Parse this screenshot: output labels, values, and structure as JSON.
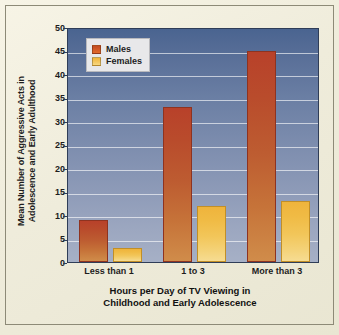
{
  "chart_data": {
    "type": "bar",
    "title": "",
    "categories": [
      "Less than 1",
      "1 to 3",
      "More than 3"
    ],
    "series": [
      {
        "name": "Males",
        "values": [
          9,
          33,
          45
        ],
        "color": "#bc4e2b"
      },
      {
        "name": "Females",
        "values": [
          3,
          12,
          13
        ],
        "color": "#f0bb45"
      }
    ],
    "xlabel": "Hours per Day of TV Viewing in\nChildhood and Early Adolescence",
    "ylabel": "Mean Number of Aggressive Acts in\nAdolescence and Early Adulthood",
    "ylim": [
      0,
      50
    ],
    "yticks": [
      "0",
      "5",
      "10",
      "15",
      "20",
      "25",
      "30",
      "35",
      "40",
      "45",
      "50"
    ],
    "ytick_values": [
      0,
      5,
      10,
      15,
      20,
      25,
      30,
      35,
      40,
      45,
      50
    ],
    "grid": true,
    "legend_position": "upper-left",
    "legend_entries": [
      "Males",
      "Females"
    ]
  },
  "colors": {
    "page_background": "#f2efdf",
    "plot_background_top": "#4a6490",
    "plot_background_bottom": "#a6b0c6",
    "gridline": "#ffffff",
    "male_bar": "#bc4e2b",
    "female_bar": "#f0bb45",
    "axis_text": "#1d1d1d",
    "frame_border": "#8d8a77"
  }
}
